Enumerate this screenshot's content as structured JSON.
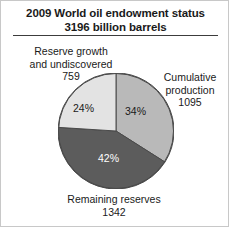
{
  "title": {
    "line1": "2009 World oil endowment status",
    "line2": "3196 billion barrels"
  },
  "labels": {
    "reserve_growth": {
      "line1": "Reserve growth",
      "line2": "and undiscovered",
      "value": "759",
      "percent": "24%"
    },
    "cumulative": {
      "line1": "Cumulative",
      "line2": "production",
      "value": "1095",
      "percent": "34%"
    },
    "remaining": {
      "line1": "Remaining reserves",
      "value": "1342",
      "percent": "42%"
    }
  },
  "colors": {
    "cumulative": "#b9b9b9",
    "remaining": "#5c5c5c",
    "reserve_growth": "#e3e3e3",
    "outline": "#4a4a4a",
    "text": "#1a1a1a",
    "text_inverse": "#ffffff"
  },
  "chart_data": {
    "type": "pie",
    "title": "2009 World oil endowment status 3196 billion barrels",
    "unit": "billion barrels",
    "total": 3196,
    "start_angle": 0,
    "direction": "clockwise",
    "legend": "none",
    "labels": [
      "Cumulative production",
      "Remaining reserves",
      "Reserve growth and undiscovered"
    ],
    "values": [
      1095,
      1342,
      759
    ],
    "percents": [
      34,
      42,
      24
    ],
    "slice_colors": [
      "#b9b9b9",
      "#5c5c5c",
      "#e3e3e3"
    ]
  }
}
